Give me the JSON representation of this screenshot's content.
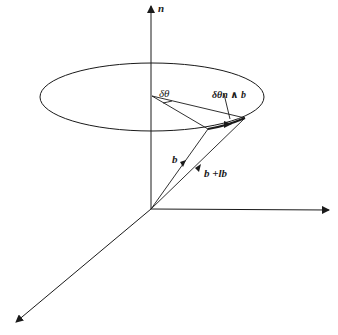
{
  "diagram": {
    "type": "vector-rotation-3d",
    "labels": {
      "axis_n": "n",
      "delta_theta": "δθ",
      "delta_theta_n_wedge_b": "δθn ∧ b",
      "vector_b": "b",
      "vector_b_plus_db": "b +lb"
    },
    "colors": {
      "stroke": "#1a1a1a",
      "background": "#ffffff"
    }
  }
}
